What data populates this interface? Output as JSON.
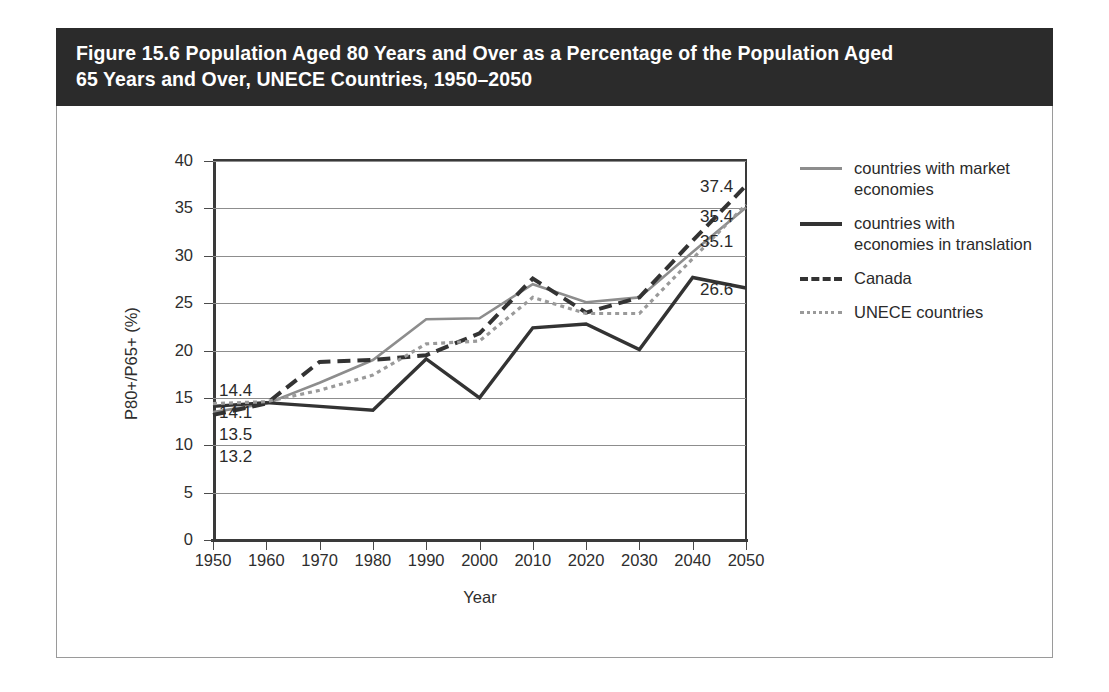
{
  "figure": {
    "title": "Figure 15.6 Population Aged 80 Years and Over as a Percentage of the Population Aged 65 Years and Over, UNECE Countries, 1950–2050",
    "title_line1": "Figure 15.6 Population Aged 80 Years and Over as a Percentage of the Population Aged",
    "title_line2": "65 Years and Over, UNECE Countries, 1950–2050",
    "banner_color": "#2b2b2b",
    "banner_text_color": "#ffffff"
  },
  "legend": {
    "position": "right",
    "items": [
      {
        "label": "countries with market economies",
        "line1": "countries with market",
        "line2": "economies",
        "style": "solid",
        "color": "#8d8d8d",
        "swatch": "sw-solid-gray"
      },
      {
        "label": "countries with economies in translation",
        "line1": "countries with",
        "line2": "economies in translation",
        "style": "solid",
        "color": "#333333",
        "swatch": "sw-solid-black"
      },
      {
        "label": "Canada",
        "line1": "Canada",
        "line2": "",
        "style": "dashed",
        "color": "#333333",
        "swatch": "sw-dashed-black"
      },
      {
        "label": "UNECE countries",
        "line1": "UNECE countries",
        "line2": "",
        "style": "dotted",
        "color": "#9a9a9a",
        "swatch": "sw-dotted-gray"
      }
    ]
  },
  "axes": {
    "y_title": "P80+/P65+ (%)",
    "x_title": "Year",
    "y_ticks": [
      "0",
      "5",
      "10",
      "15",
      "20",
      "25",
      "30",
      "35",
      "40"
    ],
    "x_ticks": [
      "1950",
      "1960",
      "1970",
      "1980",
      "1990",
      "2000",
      "2010",
      "2020",
      "2030",
      "2040",
      "2050"
    ]
  },
  "start_labels": [
    "14.4",
    "14.1",
    "13.5",
    "13.2"
  ],
  "end_labels": [
    "37.4",
    "35.4",
    "35.1",
    "26.6"
  ],
  "chart_data": {
    "type": "line",
    "title": "Figure 15.6 Population Aged 80 Years and Over as a Percentage of the Population Aged 65 Years and Over, UNECE Countries, 1950–2050",
    "xlabel": "Year",
    "ylabel": "P80+/P65+ (%)",
    "xlim": [
      1950,
      2050
    ],
    "ylim": [
      0,
      40
    ],
    "ytick_step": 5,
    "grid": true,
    "legend_position": "right",
    "categories": [
      1950,
      1960,
      1970,
      1980,
      1990,
      2000,
      2010,
      2020,
      2030,
      2040,
      2050
    ],
    "series": [
      {
        "name": "countries with market economies",
        "style": "solid",
        "color": "#8d8d8d",
        "start_value": 13.5,
        "end_value": 35.1,
        "values": [
          13.5,
          14.4,
          16.6,
          19.0,
          23.3,
          23.4,
          27.0,
          25.1,
          25.6,
          30.4,
          35.1
        ]
      },
      {
        "name": "countries with economies in translation",
        "style": "solid",
        "color": "#333333",
        "start_value": 14.1,
        "end_value": 26.6,
        "values": [
          14.1,
          14.5,
          14.1,
          13.7,
          19.1,
          15.0,
          22.4,
          22.8,
          20.1,
          27.7,
          26.6
        ]
      },
      {
        "name": "Canada",
        "style": "dashed",
        "color": "#333333",
        "start_value": 13.2,
        "end_value": 37.4,
        "values": [
          13.2,
          14.4,
          18.8,
          19.0,
          19.5,
          21.8,
          27.6,
          24.0,
          25.6,
          31.6,
          37.4
        ]
      },
      {
        "name": "UNECE countries",
        "style": "dotted",
        "color": "#9a9a9a",
        "start_value": 14.4,
        "end_value": 35.4,
        "values": [
          14.4,
          14.6,
          15.8,
          17.4,
          20.7,
          21.0,
          25.6,
          23.9,
          23.9,
          29.7,
          35.4
        ]
      }
    ]
  }
}
